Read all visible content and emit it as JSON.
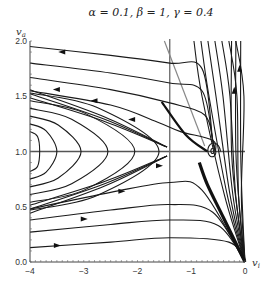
{
  "chart_data": {
    "type": "line",
    "subtype": "phase-portrait",
    "title": "α = 0.1, β = 1, γ = 0.4",
    "xlabel": "v_i",
    "ylabel": "v_a",
    "xlim": [
      -4,
      0
    ],
    "ylim": [
      0,
      2
    ],
    "xticks": [
      -4,
      -3,
      -2,
      -1,
      0
    ],
    "xtick_labels": [
      "−4",
      "−3",
      "−2",
      "−1",
      "0"
    ],
    "yticks": [
      0.0,
      0.5,
      1.0,
      1.5,
      2.0
    ],
    "ytick_labels": [
      "0.0",
      "0.5",
      "1.0",
      "1.5",
      "2.0"
    ],
    "grid": false,
    "reference_lines": {
      "horizontal_nullcline_y": 1.0,
      "vertical_nullcline_x": -1.4,
      "diagonal_nullcline": [
        [
          -1.5,
          2.0
        ],
        [
          -0.75,
          1.05
        ]
      ]
    },
    "fixed_point": {
      "x": -0.6,
      "y": 1.0,
      "type": "stable spiral"
    },
    "saddle_point": {
      "x": -1.4,
      "y": 1.0
    },
    "trajectories_upper": [
      [
        [
          -4,
          1.95
        ],
        [
          -2.5,
          1.87
        ],
        [
          -1.4,
          1.8
        ],
        [
          -0.8,
          1.75
        ]
      ],
      [
        [
          -4,
          1.8
        ],
        [
          -2.5,
          1.71
        ],
        [
          -1.4,
          1.62
        ],
        [
          -0.8,
          1.55
        ]
      ],
      [
        [
          -4,
          1.67
        ],
        [
          -2.5,
          1.56
        ],
        [
          -1.4,
          1.44
        ],
        [
          -0.75,
          1.33
        ]
      ],
      [
        [
          -4,
          1.55
        ],
        [
          -2.5,
          1.42
        ],
        [
          -1.6,
          1.26
        ],
        [
          -1.2,
          1.18
        ]
      ]
    ],
    "trajectories_lower": [
      [
        [
          -4,
          0.13
        ],
        [
          -2.5,
          0.18
        ],
        [
          -1.4,
          0.22
        ],
        [
          -0.3,
          0.18
        ],
        [
          0,
          0
        ]
      ],
      [
        [
          -4,
          0.27
        ],
        [
          -2.5,
          0.34
        ],
        [
          -1.4,
          0.38
        ],
        [
          -0.5,
          0.33
        ],
        [
          0,
          0
        ]
      ],
      [
        [
          -4,
          0.38
        ],
        [
          -2.5,
          0.47
        ],
        [
          -1.4,
          0.52
        ],
        [
          -0.6,
          0.45
        ],
        [
          0,
          0
        ]
      ],
      [
        [
          -4,
          0.48
        ],
        [
          -2.5,
          0.63
        ],
        [
          -1.4,
          0.72
        ],
        [
          -0.8,
          0.65
        ],
        [
          0,
          0
        ]
      ]
    ],
    "closed_orbits_center_x": -4,
    "closed_orbits_apex_x": [
      -3.82,
      -3.5,
      -3.05,
      -2.55,
      -2.05,
      -1.6
    ],
    "arrows": [
      {
        "x": -3.4,
        "y": 1.9,
        "dir": "left"
      },
      {
        "x": -3.5,
        "y": 1.56,
        "dir": "left"
      },
      {
        "x": -2.8,
        "y": 1.46,
        "dir": "left"
      },
      {
        "x": -2.1,
        "y": 1.29,
        "dir": "left"
      },
      {
        "x": -3.5,
        "y": 0.15,
        "dir": "right"
      },
      {
        "x": -3.0,
        "y": 0.39,
        "dir": "right"
      },
      {
        "x": -2.3,
        "y": 0.64,
        "dir": "right"
      },
      {
        "x": -1.6,
        "y": 0.87,
        "dir": "right"
      },
      {
        "x": -0.2,
        "y": 1.55,
        "dir": "up"
      },
      {
        "x": -0.1,
        "y": 1.75,
        "dir": "up"
      }
    ]
  }
}
